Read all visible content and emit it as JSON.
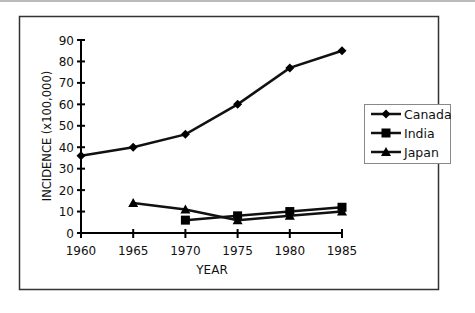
{
  "chart_data": {
    "type": "line",
    "title": "",
    "xlabel": "YEAR",
    "ylabel": "INCIDENCE (x100,000)",
    "x": [
      1960,
      1965,
      1970,
      1975,
      1980,
      1985
    ],
    "x_ticks": [
      "1960",
      "1965",
      "1970",
      "1975",
      "1980",
      "1985"
    ],
    "y_ticks": [
      "0",
      "10",
      "20",
      "30",
      "40",
      "50",
      "60",
      "70",
      "80",
      "90"
    ],
    "ylim": [
      0,
      90
    ],
    "grid": false,
    "legend_position": "right",
    "series": [
      {
        "name": "Canada",
        "marker": "diamond",
        "values": [
          36,
          40,
          46,
          60,
          77,
          85
        ]
      },
      {
        "name": "India",
        "marker": "square",
        "values": [
          null,
          null,
          6,
          8,
          10,
          12
        ]
      },
      {
        "name": "Japan",
        "marker": "triangle",
        "values": [
          null,
          14,
          11,
          6,
          8,
          10
        ]
      }
    ]
  }
}
